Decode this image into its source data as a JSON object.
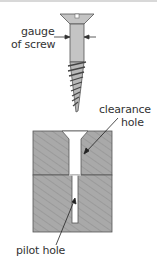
{
  "diagram": {
    "labels": {
      "gauge_line1": "gauge",
      "gauge_line2": "of screw",
      "clearance_line1": "clearance",
      "clearance_line2": "hole",
      "pilot": "pilot hole"
    },
    "colors": {
      "block_fill": "#a9a9a9",
      "hatch": "#8f8f8f",
      "screw_fill": "#c4c4c4",
      "outline": "#555555",
      "text": "#333333",
      "hole": "#ffffff"
    },
    "parts": [
      "countersunk screw",
      "upper piece with clearance hole",
      "lower piece with pilot hole"
    ]
  }
}
